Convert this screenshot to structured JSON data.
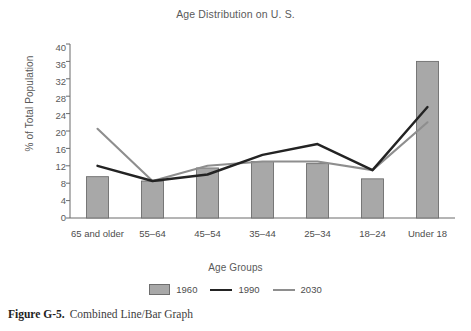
{
  "chart_data": {
    "type": "bar",
    "title": "Age Distribution on U. S.",
    "xlabel": "Age Groups",
    "ylabel": "% of Total Population",
    "categories": [
      "65 and older",
      "55–64",
      "45–54",
      "35–44",
      "25–34",
      "18–24",
      "Under 18"
    ],
    "ylim": [
      0,
      40
    ],
    "ytick_step": 4,
    "yticks": [
      "0",
      "4",
      "8",
      "12",
      "16",
      "20",
      "24",
      "28",
      "32",
      "36",
      "40"
    ],
    "grid": false,
    "legend_position": "bottom",
    "series": [
      {
        "name": "1960",
        "kind": "bar",
        "color": "#a8a8a8",
        "values": [
          9.5,
          8.5,
          11.5,
          13,
          12.5,
          9,
          36
        ]
      },
      {
        "name": "1990",
        "kind": "line",
        "color": "#232323",
        "values": [
          12,
          8.5,
          10,
          14.5,
          17,
          11,
          25.5
        ]
      },
      {
        "name": "2030",
        "kind": "line",
        "color": "#8e8e8e",
        "values": [
          20.5,
          8.5,
          12,
          13,
          13,
          11,
          22
        ]
      }
    ]
  },
  "caption": {
    "figure_number": "Figure G-5.",
    "text": "Combined Line/Bar Graph"
  }
}
